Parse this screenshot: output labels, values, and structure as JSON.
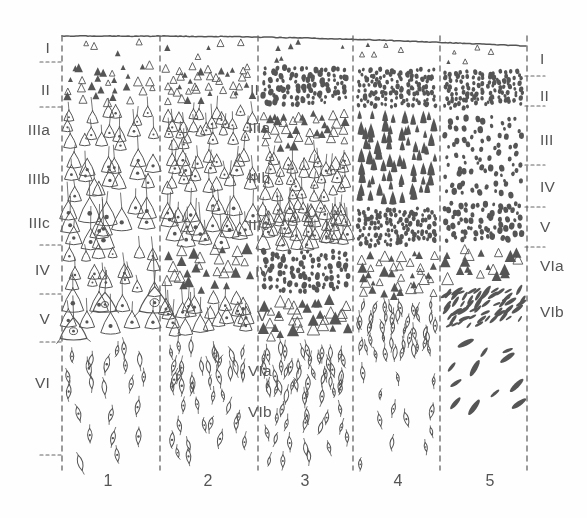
{
  "figure": {
    "background_color": "#fefefe",
    "ink_color": "#555555",
    "dash_color": "#666666",
    "width": 587,
    "height": 518
  },
  "axes": {
    "pial_surface": {
      "y_left": 36,
      "y_right": 46,
      "x_start": 62,
      "x_end": 527
    },
    "column_boundaries_x": [
      62,
      160,
      258,
      353,
      440,
      527
    ],
    "boundary_top": 36,
    "boundary_bottom": 470
  },
  "left_labels": [
    {
      "text": "I",
      "y": 48
    },
    {
      "text": "II",
      "y": 90
    },
    {
      "text": "IIIa",
      "y": 130
    },
    {
      "text": "IIIb",
      "y": 179
    },
    {
      "text": "IIIc",
      "y": 223
    },
    {
      "text": "IV",
      "y": 270
    },
    {
      "text": "V",
      "y": 319
    },
    {
      "text": "VI",
      "y": 383
    }
  ],
  "left_ticks_y": [
    62,
    107,
    245,
    294,
    342,
    455
  ],
  "inner_labels": [
    {
      "text": "II",
      "x": 250,
      "y": 90
    },
    {
      "text": "IIIa",
      "x": 248,
      "y": 128
    },
    {
      "text": "IIIb",
      "x": 248,
      "y": 178
    },
    {
      "text": "IIIc",
      "x": 248,
      "y": 225
    },
    {
      "text": "IV",
      "x": 255,
      "y": 272
    },
    {
      "text": "V",
      "x": 257,
      "y": 316
    },
    {
      "text": "VIa",
      "x": 248,
      "y": 371
    },
    {
      "text": "VIb",
      "x": 248,
      "y": 412
    }
  ],
  "right_labels": [
    {
      "text": "I",
      "y": 59
    },
    {
      "text": "II",
      "y": 96
    },
    {
      "text": "III",
      "y": 140
    },
    {
      "text": "IV",
      "y": 187
    },
    {
      "text": "V",
      "y": 227
    },
    {
      "text": "VIa",
      "y": 266
    },
    {
      "text": "VIb",
      "y": 312
    }
  ],
  "right_ticks_y": [
    76,
    106,
    165,
    207,
    247
  ],
  "column_numbers": [
    {
      "label": "1",
      "x": 108,
      "y": 481
    },
    {
      "label": "2",
      "x": 208,
      "y": 481
    },
    {
      "label": "3",
      "x": 305,
      "y": 481
    },
    {
      "label": "4",
      "x": 398,
      "y": 481
    },
    {
      "label": "5",
      "x": 490,
      "y": 481
    }
  ],
  "chart_data": {
    "type": "diagram",
    "xlabel": "Cortical area (column)",
    "ylabel": "Cortical depth / lamina",
    "columns": [
      {
        "number": "1",
        "x_range": [
          62,
          160
        ],
        "cell_style": "large sparse pyramidal neurons, prominent layer V giant pyramids",
        "bands": [
          {
            "lamina": "I",
            "y_range": [
              38,
              62
            ],
            "density": 4,
            "cell": "sparse-triangle",
            "size": [
              4,
              7
            ]
          },
          {
            "lamina": "II",
            "y_range": [
              62,
              107
            ],
            "density": 30,
            "cell": "triangle",
            "size": [
              5,
              9
            ]
          },
          {
            "lamina": "IIIa",
            "y_range": [
              107,
              152
            ],
            "density": 16,
            "cell": "pyramid",
            "size": [
              9,
              14
            ]
          },
          {
            "lamina": "IIIb",
            "y_range": [
              152,
              200
            ],
            "density": 15,
            "cell": "pyramid",
            "size": [
              12,
              17
            ]
          },
          {
            "lamina": "IIIc",
            "y_range": [
              200,
              245
            ],
            "density": 13,
            "cell": "pyramid-large",
            "size": [
              16,
              24
            ]
          },
          {
            "lamina": "IV",
            "y_range": [
              245,
              294
            ],
            "density": 18,
            "cell": "pyramid",
            "size": [
              9,
              15
            ]
          },
          {
            "lamina": "V",
            "y_range": [
              294,
              342
            ],
            "density": 11,
            "cell": "giant-pyramid",
            "size": [
              15,
              24
            ]
          },
          {
            "lamina": "VIa",
            "y_range": [
              342,
              400
            ],
            "density": 14,
            "cell": "fusiform",
            "size": [
              9,
              15
            ]
          },
          {
            "lamina": "VIb",
            "y_range": [
              400,
              470
            ],
            "density": 8,
            "cell": "fusiform",
            "size": [
              9,
              15
            ]
          }
        ]
      },
      {
        "number": "2",
        "x_range": [
          160,
          258
        ],
        "cell_style": "medium pyramidal neurons, denser than column 1",
        "bands": [
          {
            "lamina": "I",
            "y_range": [
              38,
              62
            ],
            "density": 5,
            "cell": "sparse-triangle",
            "size": [
              4,
              7
            ]
          },
          {
            "lamina": "II",
            "y_range": [
              62,
              107
            ],
            "density": 40,
            "cell": "triangle",
            "size": [
              5,
              8
            ]
          },
          {
            "lamina": "IIIa",
            "y_range": [
              107,
              152
            ],
            "density": 26,
            "cell": "pyramid",
            "size": [
              8,
              12
            ]
          },
          {
            "lamina": "IIIb",
            "y_range": [
              152,
              200
            ],
            "density": 22,
            "cell": "pyramid",
            "size": [
              10,
              15
            ]
          },
          {
            "lamina": "IIIc",
            "y_range": [
              200,
              245
            ],
            "density": 20,
            "cell": "pyramid-large",
            "size": [
              13,
              20
            ]
          },
          {
            "lamina": "IV",
            "y_range": [
              245,
              294
            ],
            "density": 30,
            "cell": "triangle",
            "size": [
              7,
              12
            ]
          },
          {
            "lamina": "V",
            "y_range": [
              294,
              342
            ],
            "density": 22,
            "cell": "pyramid",
            "size": [
              11,
              17
            ]
          },
          {
            "lamina": "VIa",
            "y_range": [
              342,
              400
            ],
            "density": 26,
            "cell": "fusiform",
            "size": [
              8,
              14
            ]
          },
          {
            "lamina": "VIb",
            "y_range": [
              400,
              470
            ],
            "density": 14,
            "cell": "fusiform",
            "size": [
              8,
              14
            ]
          }
        ]
      },
      {
        "number": "3",
        "x_range": [
          258,
          353
        ],
        "cell_style": "granular, many small cells plus medium pyramids",
        "bands": [
          {
            "lamina": "I",
            "y_range": [
              38,
              64
            ],
            "density": 7,
            "cell": "sparse-triangle",
            "size": [
              3,
              6
            ]
          },
          {
            "lamina": "II",
            "y_range": [
              64,
              108
            ],
            "density": 95,
            "cell": "granule",
            "size": [
              3,
              6
            ]
          },
          {
            "lamina": "IIIa",
            "y_range": [
              108,
              152
            ],
            "density": 40,
            "cell": "triangle",
            "size": [
              6,
              10
            ]
          },
          {
            "lamina": "IIIb",
            "y_range": [
              152,
              200
            ],
            "density": 32,
            "cell": "pyramid",
            "size": [
              8,
              13
            ]
          },
          {
            "lamina": "IIIc",
            "y_range": [
              200,
              248
            ],
            "density": 45,
            "cell": "pyramid",
            "size": [
              9,
              15
            ]
          },
          {
            "lamina": "IV",
            "y_range": [
              248,
              296
            ],
            "density": 90,
            "cell": "granule",
            "size": [
              3,
              6
            ]
          },
          {
            "lamina": "V",
            "y_range": [
              296,
              344
            ],
            "density": 34,
            "cell": "triangle",
            "size": [
              7,
              13
            ]
          },
          {
            "lamina": "VIa",
            "y_range": [
              344,
              402
            ],
            "density": 40,
            "cell": "fusiform",
            "size": [
              7,
              13
            ]
          },
          {
            "lamina": "VIb",
            "y_range": [
              402,
              470
            ],
            "density": 18,
            "cell": "fusiform",
            "size": [
              7,
              13
            ]
          }
        ]
      },
      {
        "number": "4",
        "x_range": [
          353,
          440
        ],
        "cell_style": "highly granular koniocortex, dense small dots, slim pyramids",
        "bands": [
          {
            "lamina": "I",
            "y_range": [
              40,
              66
            ],
            "density": 7,
            "cell": "sparse-triangle",
            "size": [
              3,
              6
            ]
          },
          {
            "lamina": "II",
            "y_range": [
              66,
              110
            ],
            "density": 120,
            "cell": "granule",
            "size": [
              3,
              5
            ]
          },
          {
            "lamina": "III",
            "y_range": [
              110,
              205
            ],
            "density": 70,
            "cell": "slim-pyramid",
            "size": [
              7,
              14
            ]
          },
          {
            "lamina": "IV",
            "y_range": [
              205,
              250
            ],
            "density": 115,
            "cell": "granule",
            "size": [
              3,
              5
            ]
          },
          {
            "lamina": "V",
            "y_range": [
              250,
              300
            ],
            "density": 40,
            "cell": "triangle",
            "size": [
              5,
              11
            ]
          },
          {
            "lamina": "VIa",
            "y_range": [
              300,
              360
            ],
            "density": 40,
            "cell": "fusiform",
            "size": [
              6,
              12
            ]
          },
          {
            "lamina": "VIb",
            "y_range": [
              360,
              470
            ],
            "density": 12,
            "cell": "fusiform",
            "size": [
              7,
              13
            ]
          }
        ]
      },
      {
        "number": "5",
        "x_range": [
          440,
          527
        ],
        "cell_style": "agranular/sparse, oblique slender fusiform cells in VIb",
        "bands": [
          {
            "lamina": "I",
            "y_range": [
              42,
              68
            ],
            "density": 6,
            "cell": "sparse-triangle",
            "size": [
              3,
              6
            ]
          },
          {
            "lamina": "II",
            "y_range": [
              68,
              112
            ],
            "density": 110,
            "cell": "granule",
            "size": [
              3,
              5
            ]
          },
          {
            "lamina": "III",
            "y_range": [
              112,
              200
            ],
            "density": 80,
            "cell": "granule",
            "size": [
              3,
              6
            ]
          },
          {
            "lamina": "IV",
            "y_range": [
              200,
              245
            ],
            "density": 70,
            "cell": "granule",
            "size": [
              3,
              6
            ]
          },
          {
            "lamina": "V",
            "y_range": [
              245,
              285
            ],
            "density": 20,
            "cell": "triangle",
            "size": [
              5,
              12
            ]
          },
          {
            "lamina": "VIa",
            "y_range": [
              285,
              330
            ],
            "density": 55,
            "cell": "oblique-fusiform",
            "size": [
              6,
              13
            ]
          },
          {
            "lamina": "VIb",
            "y_range": [
              330,
              420
            ],
            "density": 12,
            "cell": "oblique-fusiform",
            "size": [
              9,
              17
            ]
          }
        ]
      }
    ]
  }
}
